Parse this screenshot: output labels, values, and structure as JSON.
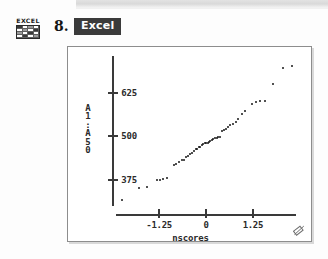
{
  "header": {
    "problem_number": "8.",
    "badge_label": "Excel",
    "icon_word": "EXCEL",
    "icon_name": "excel-spreadsheet-icon"
  },
  "figure": {
    "corner_icon_name": "resize-handle-icon"
  },
  "chart_data": {
    "type": "scatter",
    "title": "",
    "subtitle": "",
    "xlabel": "nscores",
    "ylabel": "A1:A50",
    "ylabel_stack": [
      "A",
      "1",
      ":",
      "A",
      "5",
      "0"
    ],
    "xticks": [
      "-1.25",
      "0",
      "1.25"
    ],
    "xtick_values": [
      -1.25,
      0,
      1.25
    ],
    "yticks": [
      "625",
      "500",
      "375"
    ],
    "ytick_values": [
      625,
      500,
      375
    ],
    "xlim": [
      -2.4,
      2.4
    ],
    "ylim": [
      300,
      730
    ],
    "grid": false,
    "legend": null,
    "marker": "filled-circle",
    "marker_color": "#171717",
    "n_points": 50,
    "points": [
      [
        -2.25,
        318
      ],
      [
        -1.78,
        352
      ],
      [
        -1.58,
        355
      ],
      [
        -1.32,
        374
      ],
      [
        -1.22,
        375
      ],
      [
        -1.14,
        376
      ],
      [
        -1.05,
        379
      ],
      [
        -0.86,
        417
      ],
      [
        -0.79,
        420
      ],
      [
        -0.71,
        427
      ],
      [
        -0.65,
        432
      ],
      [
        -0.59,
        433
      ],
      [
        -0.53,
        440
      ],
      [
        -0.48,
        444
      ],
      [
        -0.43,
        450
      ],
      [
        -0.38,
        452
      ],
      [
        -0.33,
        457
      ],
      [
        -0.28,
        462
      ],
      [
        -0.24,
        463
      ],
      [
        -0.19,
        468
      ],
      [
        -0.15,
        470
      ],
      [
        -0.11,
        474
      ],
      [
        -0.07,
        479
      ],
      [
        -0.04,
        480
      ],
      [
        0.0,
        481
      ],
      [
        0.04,
        482
      ],
      [
        0.08,
        483
      ],
      [
        0.11,
        487
      ],
      [
        0.15,
        490
      ],
      [
        0.19,
        491
      ],
      [
        0.24,
        494
      ],
      [
        0.28,
        496
      ],
      [
        0.33,
        497
      ],
      [
        0.38,
        497
      ],
      [
        0.43,
        516
      ],
      [
        0.48,
        519
      ],
      [
        0.53,
        521
      ],
      [
        0.59,
        526
      ],
      [
        0.65,
        531
      ],
      [
        0.71,
        534
      ],
      [
        0.79,
        541
      ],
      [
        0.86,
        549
      ],
      [
        0.95,
        565
      ],
      [
        1.05,
        571
      ],
      [
        1.22,
        592
      ],
      [
        1.32,
        597
      ],
      [
        1.45,
        600
      ],
      [
        1.58,
        601
      ],
      [
        1.78,
        650
      ],
      [
        2.05,
        697
      ],
      [
        2.28,
        700
      ]
    ]
  }
}
